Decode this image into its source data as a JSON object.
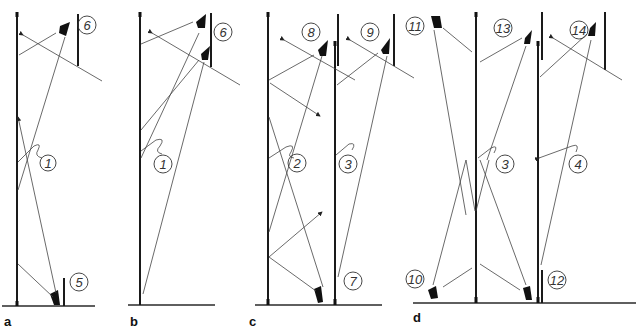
{
  "figure": {
    "panels": [
      {
        "id": "a",
        "label": "a",
        "markers": [
          "6",
          "1",
          "5"
        ]
      },
      {
        "id": "b",
        "label": "b",
        "markers": [
          "6",
          "1"
        ]
      },
      {
        "id": "c",
        "label": "c",
        "markers": [
          "8",
          "9",
          "2",
          "3",
          "7"
        ]
      },
      {
        "id": "d",
        "label": "d",
        "markers": [
          "11",
          "13",
          "14",
          "3",
          "4",
          "10",
          "12"
        ]
      }
    ],
    "colors": {
      "ink": "#1a1a1a",
      "background": "#ffffff"
    }
  }
}
